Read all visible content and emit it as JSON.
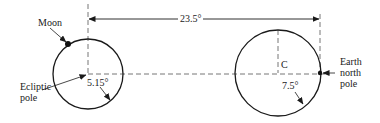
{
  "diagram": {
    "type": "celestial-pole-geometry",
    "labels": {
      "moon": "Moon",
      "ecliptic_pole_line1": "Ecliptic",
      "ecliptic_pole_line2": "pole",
      "angle_moon": "5.15°",
      "angle_top": "23.5°",
      "center": "C",
      "angle_earth": "7.5°",
      "earth_pole_line1": "Earth",
      "earth_pole_line2": "north",
      "earth_pole_line3": "pole"
    },
    "colors": {
      "line": "#1a1a1a",
      "dashed": "#555555",
      "background": "#ffffff"
    },
    "elements": {
      "left_circle": {
        "cx": 88,
        "cy": 74,
        "r": 35,
        "represents": "Moon orbit pole circle around ecliptic pole"
      },
      "right_circle": {
        "cx": 278,
        "cy": 73,
        "r": 43,
        "represents": "Circle centered at C"
      },
      "separation_angle": "23.5°"
    }
  }
}
